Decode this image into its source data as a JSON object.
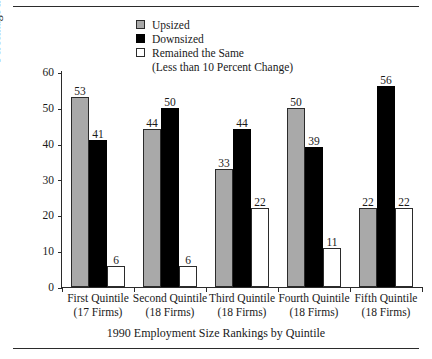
{
  "figure": {
    "top_rule": "horizontal-rule",
    "bottom_rule": "horizontal-rule"
  },
  "legend": {
    "items": [
      {
        "label": "Upsized",
        "swatch": "gray-filled-square",
        "color": "#a9a9a9"
      },
      {
        "label": "Downsized",
        "swatch": "black-filled-square",
        "color": "#000000"
      },
      {
        "label": "Remained the Same",
        "swatch": "white-outline-square",
        "color": "#ffffff"
      }
    ],
    "sublabel": "(Less than 10 Percent Change)"
  },
  "chart_data": {
    "type": "bar",
    "title": "",
    "xlabel": "1990 Employment Size Rankings by Quintile",
    "ylabel": "Percentage in Each Category",
    "ylim": [
      0,
      60
    ],
    "yticks": [
      0,
      10,
      20,
      30,
      40,
      50,
      60
    ],
    "grid": false,
    "legend_position": "top-center",
    "categories": [
      "First Quintile",
      "Second Quintile",
      "Third Quintile",
      "Fourth Quintile",
      "Fifth Quintile"
    ],
    "category_sublabels": [
      "(17 Firms)",
      "(18 Firms)",
      "(18 Firms)",
      "(18 Firms)",
      "(18 Firms)"
    ],
    "series": [
      {
        "name": "Upsized",
        "color": "#a9a9a9",
        "values": [
          53,
          44,
          33,
          50,
          22
        ]
      },
      {
        "name": "Downsized",
        "color": "#000000",
        "values": [
          41,
          50,
          44,
          39,
          56
        ]
      },
      {
        "name": "Remained the Same",
        "color": "#ffffff",
        "values": [
          6,
          6,
          22,
          11,
          22
        ]
      }
    ]
  }
}
